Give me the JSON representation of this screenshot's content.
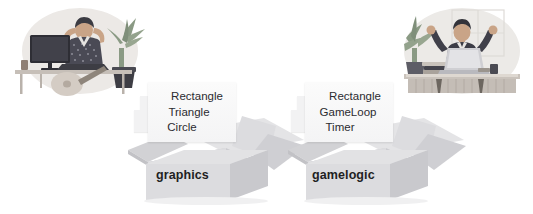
{
  "diagram": {
    "background_color": "#ffffff",
    "text_color": "#2b2b30",
    "box_color": "#d9d9dc",
    "paper_color": "#f7f7f8"
  },
  "illustrations": [
    {
      "name": "person-relaxing-at-desk",
      "description": "Person leaning back with hands behind head at a desk with monitor and plant",
      "position": "left",
      "blob_color": "#ece9e6",
      "skin_color": "#c9a487",
      "hair_color": "#3b3b42",
      "shirt_color": "#4a4a55",
      "plant_color": "#7f8f7a",
      "desk_color": "#b9b2ab",
      "monitor_color": "#2e2e35"
    },
    {
      "name": "person-celebrating-at-laptop",
      "description": "Person with both arms raised in celebration behind a laptop on a desk with plant",
      "position": "right",
      "blob_color": "#eceae7",
      "skin_color": "#c9a487",
      "hair_color": "#33333a",
      "shirt_color": "#3c3c46",
      "plant_color": "#7f8f7a",
      "desk_color": "#b9b2ab",
      "laptop_color": "#cfcfd3"
    }
  ],
  "packages": [
    {
      "id": "graphics",
      "box_label": "graphics",
      "modules": [
        "Rectangle",
        "Triangle",
        "Circle"
      ]
    },
    {
      "id": "gamelogic",
      "box_label": "gamelogic",
      "modules": [
        "Rectangle",
        "GameLoop",
        "Timer"
      ]
    }
  ]
}
